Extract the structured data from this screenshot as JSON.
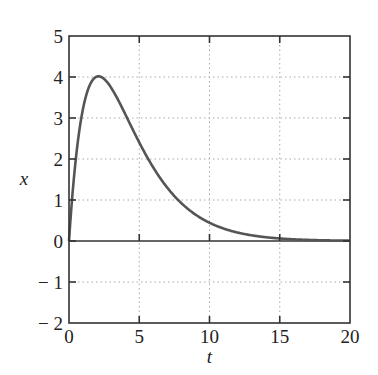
{
  "chart_data": {
    "type": "line",
    "title": "",
    "xlabel": "t",
    "ylabel": "x",
    "xlim": [
      0,
      20
    ],
    "ylim": [
      -2,
      5
    ],
    "xticks": [
      0,
      5,
      10,
      15,
      20
    ],
    "yticks": [
      -2,
      -1,
      0,
      1,
      2,
      3,
      4,
      5
    ],
    "xtick_labels": [
      "0",
      "5",
      "10",
      "15",
      "20"
    ],
    "ytick_labels": [
      "− 2",
      "− 1",
      "0",
      "1",
      "2",
      "3",
      "4",
      "5"
    ],
    "grid": true,
    "legend": null,
    "zero_line": true,
    "series": [
      {
        "name": "x(t)",
        "color": "#555555",
        "x": [
          0,
          0.5,
          1,
          1.5,
          2,
          2.1,
          2.5,
          3,
          4,
          5,
          6,
          7,
          8,
          9,
          10,
          11,
          12,
          13,
          14,
          15,
          16,
          17,
          18,
          19,
          20
        ],
        "y": [
          0,
          2.05,
          3.26,
          3.83,
          4.0,
          4.02,
          3.96,
          3.75,
          3.1,
          2.4,
          1.79,
          1.3,
          0.92,
          0.64,
          0.45,
          0.31,
          0.21,
          0.14,
          0.094,
          0.062,
          0.041,
          0.027,
          0.018,
          0.011,
          0.007
        ]
      }
    ]
  }
}
